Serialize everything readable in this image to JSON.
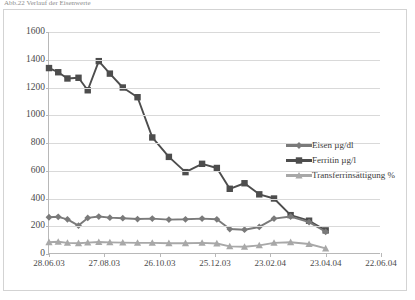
{
  "title_truncated": "Abb.22  Verlauf der Eisenwerte",
  "legend": {
    "position": "inside-right",
    "items": [
      {
        "label": "Eisen µg/dl",
        "marker": "diamond",
        "color": "#7a7a7a"
      },
      {
        "label": "Ferritin µg/l",
        "marker": "square",
        "color": "#4d4d4d"
      },
      {
        "label": "Transferrinsättigung %",
        "marker": "triangle",
        "color": "#a8a8a8"
      }
    ]
  },
  "chart_data": {
    "type": "line",
    "title": "Abb.22  Verlauf der Eisenwerte",
    "xlabel": "",
    "ylabel": "",
    "ylim": [
      0,
      1600
    ],
    "ytick_step": 200,
    "yticks": [
      0,
      200,
      400,
      600,
      800,
      1000,
      1200,
      1400,
      1600
    ],
    "grid": true,
    "xticks": [
      "28.06.03",
      "27.08.03",
      "26.10.03",
      "25.12.03",
      "23.02.04",
      "23.04.04",
      "22.06.04"
    ],
    "x_axis_type": "date",
    "x_start": "28.06.03",
    "x_end": "22.06.04",
    "x_tick_interval_days": 60,
    "legend_position": "inside-right",
    "series": [
      {
        "name": "Ferritin µg/l",
        "color": "#4d4d4d",
        "marker": "square",
        "x_days": [
          0,
          10,
          20,
          32,
          42,
          54,
          66,
          80,
          96,
          112,
          130,
          148,
          166,
          182,
          196,
          212,
          228,
          244,
          262,
          282,
          300
        ],
        "values": [
          1340,
          1310,
          1265,
          1270,
          1180,
          1390,
          1300,
          1200,
          1130,
          840,
          700,
          590,
          650,
          620,
          470,
          510,
          430,
          400,
          280,
          240,
          170
        ]
      },
      {
        "name": "Eisen µg/dl",
        "color": "#7a7a7a",
        "marker": "diamond",
        "x_days": [
          0,
          10,
          20,
          32,
          42,
          54,
          66,
          80,
          96,
          112,
          130,
          148,
          166,
          182,
          196,
          212,
          228,
          244,
          262,
          282,
          300
        ],
        "values": [
          265,
          268,
          250,
          205,
          260,
          270,
          262,
          258,
          252,
          255,
          248,
          250,
          255,
          250,
          180,
          175,
          195,
          255,
          270,
          230,
          160
        ]
      },
      {
        "name": "Transferrinsättigung %",
        "color": "#a8a8a8",
        "marker": "triangle",
        "x_days": [
          0,
          10,
          20,
          32,
          42,
          54,
          66,
          80,
          96,
          112,
          130,
          148,
          166,
          182,
          196,
          212,
          228,
          244,
          262,
          282,
          300
        ],
        "values": [
          85,
          88,
          80,
          78,
          82,
          86,
          84,
          82,
          80,
          80,
          78,
          78,
          80,
          76,
          55,
          52,
          62,
          80,
          85,
          72,
          40
        ]
      }
    ]
  }
}
